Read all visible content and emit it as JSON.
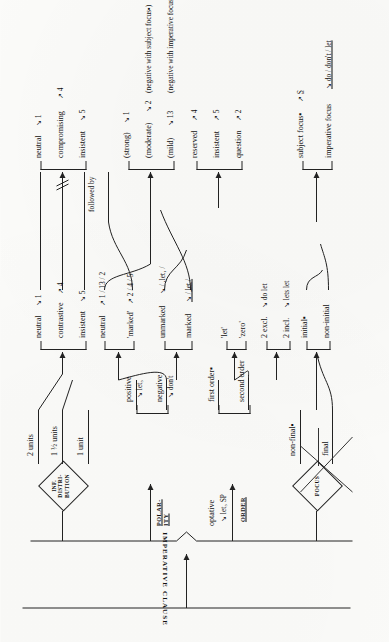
{
  "diagram": {
    "title": "IMPERATIVE CLAUSE",
    "type": "system-network",
    "root_label": "IMPERATIVE CLAUSE",
    "followed_by_label": "followed by"
  },
  "systems": [
    {
      "id": "inf-distribution",
      "name": "INF. DISTRI-BUTION",
      "shape": "diamond"
    },
    {
      "id": "polarity",
      "name": "POLAR-ITY",
      "shape": "bracket",
      "underlined": true
    },
    {
      "id": "order",
      "name": "ORDER",
      "shape": "bracket",
      "underlined": true
    },
    {
      "id": "focus",
      "name": "FOCUS",
      "shape": "diamond"
    }
  ],
  "entry": {
    "optative": "optative",
    "optative_realization": "↘ let₃ SP"
  },
  "inf_distribution": {
    "options": [
      {
        "label": "2 units"
      },
      {
        "label": "1 ½ units"
      },
      {
        "label": "1 unit"
      }
    ]
  },
  "polarity": {
    "options": [
      {
        "label": "positive",
        "realization": "↘ let₃"
      },
      {
        "label": "negative",
        "realization": "↘ don't"
      }
    ]
  },
  "order": {
    "options": [
      {
        "label": "first order▪"
      },
      {
        "label": "second order"
      }
    ]
  },
  "focus": {
    "options": [
      {
        "label": "non-final▪"
      },
      {
        "label": "final"
      }
    ]
  },
  "tone_groups": [
    {
      "id": "tone-neutral-contrastive",
      "options": [
        {
          "label": "neutral",
          "realization": "↘ 1"
        },
        {
          "label": "contrastive",
          "realization": "↗ 4"
        },
        {
          "label": "insistent",
          "realization": "↘ 5"
        }
      ]
    },
    {
      "id": "tone-neutral-marked",
      "options": [
        {
          "label": "neutral",
          "realization": "↗ 1 / 13 / 2"
        },
        {
          "label": "'marked'",
          "realization": "↗ 2 / 4 / 5"
        }
      ]
    },
    {
      "id": "markedness",
      "options": [
        {
          "label": "unmarked",
          "realization": "↘ / ,let₁ /"
        },
        {
          "label": "marked",
          "realization": "↘ / ̲l̲e̲t̲ /"
        }
      ]
    },
    {
      "id": "let-zero",
      "options": [
        {
          "label": "'let'"
        },
        {
          "label": "'zero'"
        }
      ]
    },
    {
      "id": "person",
      "options": [
        {
          "label": "2 excl.",
          "realization": "↘ do let"
        },
        {
          "label": "2 incl.",
          "realization": "↘ lets let"
        }
      ]
    },
    {
      "id": "initiality",
      "options": [
        {
          "label": "initial▪"
        },
        {
          "label": "non-initial"
        }
      ]
    }
  ],
  "outcome_groups": [
    {
      "id": "out-neutral-compromising",
      "options": [
        {
          "label": "neutral",
          "realization": "↘ 1"
        },
        {
          "label": "compromising",
          "realization": "↗ 4"
        },
        {
          "label": "insistent",
          "realization": "↘ 5"
        }
      ]
    },
    {
      "id": "out-strength",
      "options": [
        {
          "label": "(strong)",
          "realization": "↘ 1",
          "note": ""
        },
        {
          "label": "(moderate)",
          "realization": "↘ 2",
          "note": "(negative with subject focus▪)"
        },
        {
          "label": "(mild)",
          "realization": "↘ 13",
          "note": "(negative with imperative focus▪)"
        }
      ]
    },
    {
      "id": "out-reserved",
      "options": [
        {
          "label": "reserved",
          "realization": "↗ 4"
        },
        {
          "label": "insistent",
          "realization": "↗ 5"
        },
        {
          "label": "question",
          "realization": "↗ 2"
        }
      ]
    },
    {
      "id": "out-focus",
      "options": [
        {
          "label": "subject focus▪",
          "realization": "↗ S̲"
        },
        {
          "label": "imperative focus",
          "realization": "↘ do / don't / let",
          "underlined_realization": true
        }
      ]
    }
  ],
  "colors": {
    "ink": "#1a1a1a",
    "paper": "#fbfbf9",
    "rule": "#222222"
  }
}
